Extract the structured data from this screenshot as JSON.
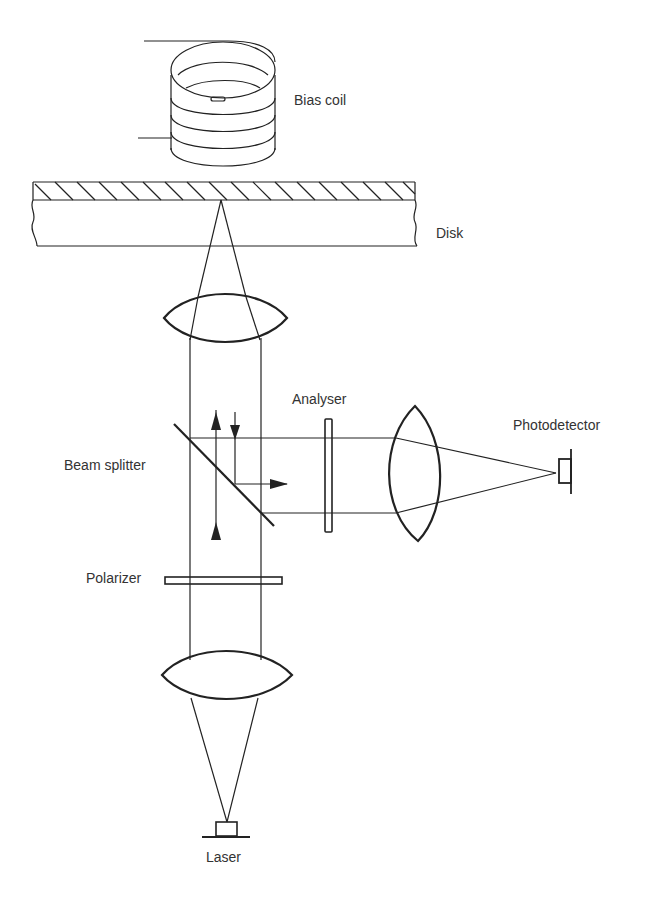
{
  "diagram": {
    "type": "magneto-optical disk read head",
    "labels": {
      "bias_coil": "Bias coil",
      "disk": "Disk",
      "analyser": "Analyser",
      "photodetector": "Photodetector",
      "beam_splitter": "Beam splitter",
      "polarizer": "Polarizer",
      "laser": "Laser"
    },
    "components": [
      {
        "id": "bias-coil",
        "label": "Bias coil"
      },
      {
        "id": "disk",
        "label": "Disk"
      },
      {
        "id": "objective-lens",
        "label": ""
      },
      {
        "id": "beam-splitter",
        "label": "Beam splitter"
      },
      {
        "id": "analyser",
        "label": "Analyser"
      },
      {
        "id": "detector-lens",
        "label": ""
      },
      {
        "id": "photodetector",
        "label": "Photodetector"
      },
      {
        "id": "polarizer",
        "label": "Polarizer"
      },
      {
        "id": "collimator-lens",
        "label": ""
      },
      {
        "id": "laser",
        "label": "Laser"
      }
    ],
    "colors": {
      "ink": "#222222",
      "text": "#333333",
      "background": "#ffffff"
    }
  }
}
